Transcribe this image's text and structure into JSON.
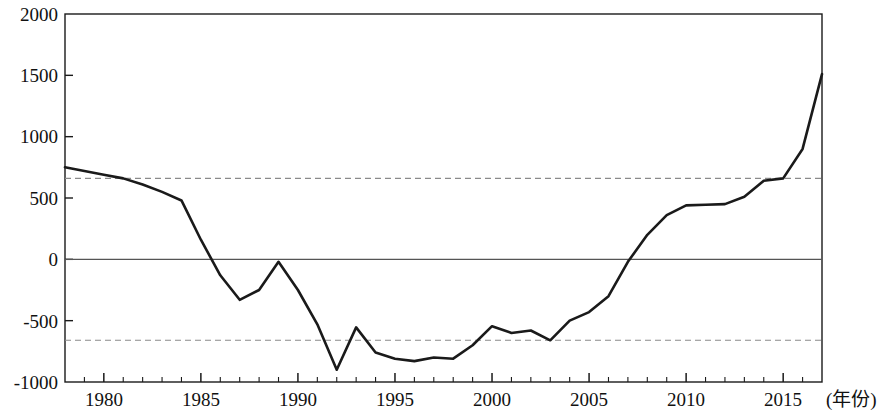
{
  "chart_data": {
    "type": "line",
    "title": "",
    "subtitle": "",
    "xlabel": "(年份)",
    "ylabel": "",
    "xlim": [
      1978,
      2017
    ],
    "ylim": [
      -1000,
      2000
    ],
    "grid": false,
    "legend": null,
    "x_tick_labels": [
      "1980",
      "1985",
      "1990",
      "1995",
      "2000",
      "2005",
      "2010",
      "2015"
    ],
    "x_tick_values": [
      1980,
      1985,
      1990,
      1995,
      2000,
      2005,
      2010,
      2015
    ],
    "x_minor_tick_step": 1,
    "y_tick_labels": [
      "2000",
      "1500",
      "1000",
      "500",
      "0",
      "-500",
      "-1000"
    ],
    "y_tick_values": [
      2000,
      1500,
      1000,
      500,
      0,
      -500,
      -1000
    ],
    "reference_lines": [
      {
        "name": "upper-threshold",
        "value": 660,
        "style": "dashed",
        "color": "#8a8a8a"
      },
      {
        "name": "zero-line",
        "value": 0,
        "style": "solid",
        "color": "#555555"
      },
      {
        "name": "lower-threshold",
        "value": -660,
        "style": "dashed",
        "color": "#8a8a8a"
      }
    ],
    "series": [
      {
        "name": "series-1",
        "color": "#1a1a1a",
        "x": [
          1978,
          1979,
          1980,
          1981,
          1982,
          1983,
          1984,
          1985,
          1986,
          1987,
          1988,
          1989,
          1990,
          1991,
          1992,
          1993,
          1994,
          1995,
          1996,
          1997,
          1998,
          1999,
          2000,
          2001,
          2002,
          2003,
          2004,
          2005,
          2006,
          2007,
          2008,
          2009,
          2010,
          2011,
          2012,
          2013,
          2014,
          2015,
          2016,
          2017
        ],
        "values": [
          750,
          720,
          690,
          660,
          610,
          550,
          480,
          160,
          -130,
          -330,
          -250,
          -20,
          -250,
          -530,
          -900,
          -555,
          -760,
          -810,
          -830,
          -800,
          -810,
          -700,
          -545,
          -600,
          -580,
          -660,
          -500,
          -430,
          -300,
          -20,
          200,
          360,
          440,
          445,
          450,
          510,
          640,
          660,
          900,
          1510
        ]
      }
    ]
  },
  "axis": {
    "x_axis_unit_label": "(年份)"
  }
}
